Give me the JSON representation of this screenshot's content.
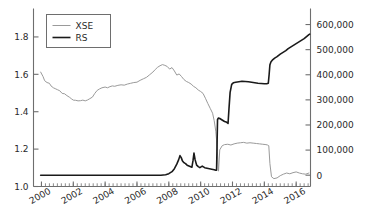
{
  "chart_data": {
    "type": "line",
    "title": "",
    "subtitle": "",
    "xlabel": "",
    "ylabel": "",
    "y2label": "",
    "grid": false,
    "legend_position": "top-left",
    "xlim": [
      1999.5,
      2016.9
    ],
    "xticks": [
      2000,
      2002,
      2004,
      2006,
      2008,
      2010,
      2012,
      2014,
      2016
    ],
    "xticklabels": [
      "2000",
      "2002",
      "2004",
      "2006",
      "2008",
      "2010",
      "2012",
      "2014",
      "2016"
    ],
    "xminor_interval": 0.25,
    "ylim_left": [
      1.0,
      1.92
    ],
    "yticks_left": [
      1.0,
      1.2,
      1.4,
      1.6,
      1.8
    ],
    "yticklabels_left": [
      "1.0",
      "1.2",
      "1.4",
      "1.6",
      "1.8"
    ],
    "ylim_right": [
      -45000,
      640000
    ],
    "yticks_right": [
      0,
      100000,
      200000,
      300000,
      400000,
      500000,
      600000
    ],
    "yticklabels_right": [
      "0",
      "100,000",
      "200,000",
      "300,000",
      "400,000",
      "500,000",
      "600,000"
    ],
    "series": [
      {
        "name": "XSE",
        "axis": "left",
        "color": "#9a9a9a",
        "linewidth": 1.0,
        "x": [
          1999.95,
          2000.1,
          2000.2,
          2000.35,
          2000.5,
          2000.6,
          2000.75,
          2000.9,
          2001.0,
          2001.15,
          2001.3,
          2001.45,
          2001.6,
          2001.75,
          2001.9,
          2002.0,
          2002.15,
          2002.3,
          2002.45,
          2002.6,
          2002.75,
          2002.9,
          2003.0,
          2003.2,
          2003.35,
          2003.5,
          2003.65,
          2003.8,
          2004.0,
          2004.15,
          2004.3,
          2004.45,
          2004.6,
          2004.8,
          2005.0,
          2005.2,
          2005.4,
          2005.6,
          2005.8,
          2006.0,
          2006.2,
          2006.4,
          2006.6,
          2006.8,
          2007.0,
          2007.15,
          2007.3,
          2007.45,
          2007.6,
          2007.75,
          2007.9,
          2008.05,
          2008.2,
          2008.35,
          2008.5,
          2008.65,
          2008.8,
          2008.95,
          2009.1,
          2009.25,
          2009.4,
          2009.55,
          2009.7,
          2009.85,
          2010.0,
          2010.15,
          2010.3,
          2010.45,
          2010.6,
          2010.75,
          2010.85,
          2010.95,
          2011.0,
          2011.05,
          2011.12,
          2011.2,
          2011.35,
          2011.5,
          2011.7,
          2011.9,
          2012.1,
          2012.3,
          2012.5,
          2012.7,
          2012.9,
          2013.1,
          2013.3,
          2013.5,
          2013.7,
          2013.9,
          2014.1,
          2014.2,
          2014.28,
          2014.35,
          2014.45,
          2014.6,
          2014.8,
          2015.0,
          2015.2,
          2015.4,
          2015.6,
          2015.8,
          2016.0,
          2016.2,
          2016.4,
          2016.6,
          2016.8
        ],
        "y": [
          1.612,
          1.588,
          1.566,
          1.556,
          1.552,
          1.538,
          1.528,
          1.522,
          1.518,
          1.512,
          1.498,
          1.496,
          1.486,
          1.478,
          1.468,
          1.462,
          1.461,
          1.458,
          1.459,
          1.462,
          1.458,
          1.463,
          1.468,
          1.478,
          1.498,
          1.514,
          1.522,
          1.528,
          1.532,
          1.528,
          1.534,
          1.538,
          1.536,
          1.541,
          1.544,
          1.542,
          1.548,
          1.552,
          1.556,
          1.558,
          1.568,
          1.576,
          1.584,
          1.598,
          1.612,
          1.626,
          1.638,
          1.646,
          1.652,
          1.648,
          1.642,
          1.628,
          1.636,
          1.618,
          1.596,
          1.602,
          1.588,
          1.572,
          1.562,
          1.556,
          1.548,
          1.536,
          1.528,
          1.516,
          1.508,
          1.498,
          1.472,
          1.444,
          1.418,
          1.392,
          1.352,
          1.296,
          1.248,
          1.188,
          1.082,
          1.196,
          1.218,
          1.224,
          1.226,
          1.222,
          1.228,
          1.232,
          1.234,
          1.236,
          1.232,
          1.234,
          1.232,
          1.23,
          1.228,
          1.226,
          1.224,
          1.222,
          1.218,
          1.122,
          1.052,
          1.042,
          1.046,
          1.058,
          1.066,
          1.072,
          1.068,
          1.074,
          1.078,
          1.072,
          1.068,
          1.066,
          1.072
        ]
      },
      {
        "name": "RS",
        "axis": "right",
        "color": "#1a1a1a",
        "linewidth": 1.6,
        "x": [
          1999.95,
          2000.5,
          2001.0,
          2001.5,
          2002.0,
          2002.5,
          2003.0,
          2003.5,
          2004.0,
          2004.5,
          2005.0,
          2005.5,
          2006.0,
          2006.5,
          2007.0,
          2007.5,
          2007.8,
          2008.0,
          2008.2,
          2008.35,
          2008.5,
          2008.62,
          2008.7,
          2008.78,
          2008.85,
          2008.95,
          2009.05,
          2009.15,
          2009.3,
          2009.45,
          2009.52,
          2009.58,
          2009.65,
          2009.75,
          2009.85,
          2009.95,
          2010.1,
          2010.25,
          2010.4,
          2010.55,
          2010.7,
          2010.85,
          2010.95,
          2011.0,
          2011.03,
          2011.06,
          2011.12,
          2011.2,
          2011.3,
          2011.4,
          2011.5,
          2011.6,
          2011.68,
          2011.72,
          2011.78,
          2011.85,
          2011.95,
          2012.05,
          2012.2,
          2012.4,
          2012.6,
          2012.8,
          2013.0,
          2013.2,
          2013.4,
          2013.6,
          2013.8,
          2014.0,
          2014.15,
          2014.25,
          2014.3,
          2014.35,
          2014.42,
          2014.5,
          2014.65,
          2014.8,
          2015.0,
          2015.2,
          2015.35,
          2015.5,
          2015.7,
          2015.9,
          2016.1,
          2016.3,
          2016.5,
          2016.65,
          2016.8,
          2016.85
        ],
        "y": [
          0,
          0,
          0,
          0,
          0,
          0,
          0,
          0,
          0,
          0,
          0,
          0,
          0,
          0,
          0,
          0,
          2000,
          6000,
          14000,
          26000,
          44000,
          62000,
          78000,
          70000,
          58000,
          50000,
          46000,
          40000,
          36000,
          32000,
          58000,
          88000,
          62000,
          40000,
          34000,
          30000,
          36000,
          30000,
          28000,
          26000,
          24000,
          22000,
          20000,
          20000,
          120000,
          222000,
          228000,
          226000,
          222000,
          218000,
          214000,
          212000,
          208000,
          206000,
          265000,
          330000,
          362000,
          368000,
          370000,
          372000,
          374000,
          373000,
          372000,
          370000,
          368000,
          366000,
          365000,
          364000,
          364000,
          366000,
          400000,
          440000,
          452000,
          458000,
          466000,
          472000,
          482000,
          490000,
          496000,
          504000,
          512000,
          520000,
          528000,
          536000,
          544000,
          552000,
          560000,
          562000
        ]
      }
    ],
    "legend_entries": [
      {
        "label": "XSE",
        "color": "#9a9a9a",
        "linewidth": 1.0
      },
      {
        "label": "RS",
        "color": "#1a1a1a",
        "linewidth": 1.6
      }
    ]
  },
  "colors": {
    "axis": "#6e6e6e",
    "text": "#2a2a2a",
    "background": "#ffffff",
    "legend_border": "#6e6e6e",
    "xse": "#9a9a9a",
    "rs": "#1a1a1a"
  }
}
